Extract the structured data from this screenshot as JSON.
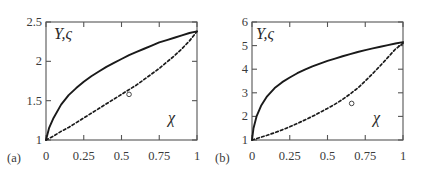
{
  "figure": {
    "panels": [
      {
        "tag": "(a)",
        "y_axis_title": "Y,ς",
        "x_axis_title": "χ",
        "x_ticks": [
          "0",
          "0.25",
          "0.5",
          "0.75",
          "1"
        ],
        "y_ticks": [
          "1",
          "1.5",
          "2",
          "2.5"
        ]
      },
      {
        "tag": "(b)",
        "y_axis_title": "Y,ς",
        "x_axis_title": "χ",
        "x_ticks": [
          "0",
          "0.25",
          "0.5",
          "0.75",
          "1"
        ],
        "y_ticks": [
          "1",
          "2",
          "3",
          "4",
          "5",
          "6"
        ]
      }
    ]
  },
  "chart_data": [
    {
      "type": "line",
      "panel": "(a)",
      "title": "",
      "xlabel": "χ",
      "ylabel": "Y,ς",
      "xlim": [
        0,
        1
      ],
      "ylim": [
        1,
        2.5
      ],
      "xticks": [
        0,
        0.25,
        0.5,
        0.75,
        1
      ],
      "yticks": [
        1,
        1.5,
        2,
        2.5
      ],
      "grid": false,
      "legend": null,
      "frame": "full-box",
      "series": [
        {
          "name": "Y",
          "style": "solid",
          "color": "#1a1a1a",
          "x": [
            0,
            0.02,
            0.05,
            0.1,
            0.15,
            0.2,
            0.25,
            0.3,
            0.35,
            0.4,
            0.45,
            0.5,
            0.55,
            0.6,
            0.65,
            0.7,
            0.75,
            0.8,
            0.85,
            0.9,
            0.95,
            1
          ],
          "y": [
            1.0,
            1.15,
            1.28,
            1.45,
            1.57,
            1.66,
            1.74,
            1.81,
            1.87,
            1.93,
            1.98,
            2.03,
            2.08,
            2.12,
            2.16,
            2.2,
            2.24,
            2.27,
            2.3,
            2.33,
            2.36,
            2.38
          ]
        },
        {
          "name": "ς",
          "style": "dashed",
          "color": "#1a1a1a",
          "x": [
            0,
            0.05,
            0.1,
            0.15,
            0.2,
            0.25,
            0.3,
            0.35,
            0.4,
            0.45,
            0.5,
            0.55,
            0.6,
            0.65,
            0.7,
            0.75,
            0.8,
            0.85,
            0.9,
            0.95,
            1
          ],
          "y": [
            1.0,
            1.05,
            1.11,
            1.16,
            1.22,
            1.28,
            1.34,
            1.4,
            1.46,
            1.52,
            1.58,
            1.64,
            1.7,
            1.77,
            1.84,
            1.91,
            1.99,
            2.07,
            2.16,
            2.26,
            2.38
          ]
        }
      ],
      "markers": [
        {
          "x": 0.55,
          "y": 1.58,
          "shape": "open-circle",
          "series": "ς"
        }
      ]
    },
    {
      "type": "line",
      "panel": "(b)",
      "title": "",
      "xlabel": "χ",
      "ylabel": "Y,ς",
      "xlim": [
        0,
        1
      ],
      "ylim": [
        1,
        6
      ],
      "xticks": [
        0,
        0.25,
        0.5,
        0.75,
        1
      ],
      "yticks": [
        1,
        2,
        3,
        4,
        5,
        6
      ],
      "grid": false,
      "legend": null,
      "frame": "full-box",
      "series": [
        {
          "name": "Y",
          "style": "solid",
          "color": "#1a1a1a",
          "x": [
            0,
            0.01,
            0.03,
            0.06,
            0.1,
            0.15,
            0.2,
            0.25,
            0.3,
            0.35,
            0.4,
            0.45,
            0.5,
            0.55,
            0.6,
            0.65,
            0.7,
            0.75,
            0.8,
            0.85,
            0.9,
            0.95,
            1
          ],
          "y": [
            1.0,
            1.5,
            2.0,
            2.45,
            2.85,
            3.2,
            3.45,
            3.65,
            3.83,
            3.98,
            4.12,
            4.24,
            4.35,
            4.45,
            4.55,
            4.64,
            4.73,
            4.81,
            4.88,
            4.95,
            5.02,
            5.09,
            5.15
          ]
        },
        {
          "name": "ς",
          "style": "dashed",
          "color": "#1a1a1a",
          "x": [
            0,
            0.05,
            0.1,
            0.15,
            0.2,
            0.25,
            0.3,
            0.35,
            0.4,
            0.45,
            0.5,
            0.55,
            0.6,
            0.65,
            0.7,
            0.75,
            0.8,
            0.85,
            0.9,
            0.95,
            0.98,
            1
          ],
          "y": [
            1.0,
            1.1,
            1.2,
            1.31,
            1.43,
            1.56,
            1.7,
            1.85,
            2.0,
            2.17,
            2.34,
            2.52,
            2.72,
            2.95,
            3.2,
            3.5,
            3.82,
            4.15,
            4.5,
            4.85,
            5.0,
            5.1
          ]
        }
      ],
      "markers": [
        {
          "x": 0.66,
          "y": 2.55,
          "shape": "open-circle",
          "series": "ς"
        }
      ]
    }
  ]
}
